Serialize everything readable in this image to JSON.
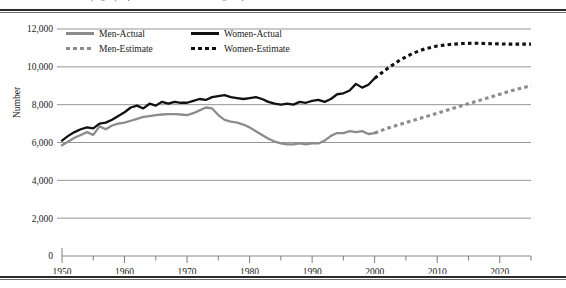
{
  "top_caption": "of 5 (English). http://www.imdb.com/chart/ch07/tt0_chart.pdf",
  "legend": {
    "items": [
      {
        "label": "Men-Actual",
        "style": "solid",
        "color": "#8c8c8c"
      },
      {
        "label": "Women-Actual",
        "style": "solid",
        "color": "#111111"
      },
      {
        "label": "Men-Estimate",
        "style": "dashed",
        "color": "#8c8c8c"
      },
      {
        "label": "Women-Estimate",
        "style": "dashed",
        "color": "#111111"
      }
    ]
  },
  "chart_data": {
    "type": "line",
    "title": "",
    "xlabel": "",
    "ylabel": "Number",
    "xlim": [
      1950,
      2025
    ],
    "ylim": [
      0,
      12000
    ],
    "grid": true,
    "legend_position": "top-left-inside",
    "ytick_labels": [
      "0",
      "2,000",
      "4,000",
      "6,000",
      "8,000",
      "10,000",
      "12,000"
    ],
    "ytick_values": [
      0,
      2000,
      4000,
      6000,
      8000,
      10000,
      12000
    ],
    "xtick_labels": [
      "1950",
      "1960",
      "1970",
      "1980",
      "1990",
      "2000",
      "2010",
      "2020"
    ],
    "xtick_values": [
      1950,
      1960,
      1970,
      1980,
      1990,
      2000,
      2010,
      2020
    ],
    "xminor_step": 5,
    "series": [
      {
        "name": "Men-Actual",
        "style": "solid",
        "color": "#8c8c8c",
        "x": [
          1950,
          1951,
          1952,
          1953,
          1954,
          1955,
          1956,
          1957,
          1958,
          1959,
          1960,
          1961,
          1962,
          1963,
          1964,
          1965,
          1966,
          1967,
          1968,
          1969,
          1970,
          1971,
          1972,
          1973,
          1974,
          1975,
          1976,
          1977,
          1978,
          1979,
          1980,
          1981,
          1982,
          1983,
          1984,
          1985,
          1986,
          1987,
          1988,
          1989,
          1990,
          1991,
          1992,
          1993,
          1994,
          1995,
          1996,
          1997,
          1998,
          1999,
          2000
        ],
        "y": [
          5850,
          6050,
          6250,
          6400,
          6550,
          6400,
          6850,
          6700,
          6900,
          7000,
          7050,
          7150,
          7250,
          7350,
          7400,
          7450,
          7480,
          7500,
          7500,
          7480,
          7450,
          7550,
          7700,
          7850,
          7800,
          7450,
          7200,
          7100,
          7050,
          6950,
          6800,
          6600,
          6400,
          6200,
          6050,
          5950,
          5900,
          5900,
          5950,
          5900,
          5950,
          5950,
          6100,
          6350,
          6500,
          6500,
          6600,
          6550,
          6600,
          6450,
          6500
        ]
      },
      {
        "name": "Women-Actual",
        "style": "solid",
        "color": "#111111",
        "x": [
          1950,
          1951,
          1952,
          1953,
          1954,
          1955,
          1956,
          1957,
          1958,
          1959,
          1960,
          1961,
          1962,
          1963,
          1964,
          1965,
          1966,
          1967,
          1968,
          1969,
          1970,
          1971,
          1972,
          1973,
          1974,
          1975,
          1976,
          1977,
          1978,
          1979,
          1980,
          1981,
          1982,
          1983,
          1984,
          1985,
          1986,
          1987,
          1988,
          1989,
          1990,
          1991,
          1992,
          1993,
          1994,
          1995,
          1996,
          1997,
          1998,
          1999,
          2000
        ],
        "y": [
          6100,
          6350,
          6550,
          6700,
          6800,
          6750,
          7000,
          7050,
          7200,
          7400,
          7600,
          7850,
          7950,
          7800,
          8050,
          7950,
          8150,
          8050,
          8150,
          8100,
          8100,
          8200,
          8300,
          8250,
          8400,
          8450,
          8500,
          8400,
          8350,
          8300,
          8350,
          8400,
          8300,
          8150,
          8050,
          8000,
          8050,
          8000,
          8150,
          8100,
          8200,
          8250,
          8150,
          8300,
          8550,
          8600,
          8750,
          9100,
          8900,
          9050,
          9400
        ]
      },
      {
        "name": "Men-Estimate",
        "style": "dashed",
        "color": "#8c8c8c",
        "x": [
          2000,
          2002,
          2004,
          2006,
          2008,
          2010,
          2012,
          2014,
          2016,
          2018,
          2020,
          2022,
          2025
        ],
        "y": [
          6500,
          6750,
          6950,
          7150,
          7350,
          7550,
          7750,
          7950,
          8150,
          8350,
          8550,
          8750,
          9000
        ]
      },
      {
        "name": "Women-Estimate",
        "style": "dashed",
        "color": "#111111",
        "x": [
          2000,
          2002,
          2004,
          2006,
          2008,
          2010,
          2012,
          2014,
          2016,
          2018,
          2020,
          2022,
          2025
        ],
        "y": [
          9400,
          9900,
          10350,
          10700,
          10950,
          11100,
          11180,
          11230,
          11250,
          11230,
          11210,
          11200,
          11200
        ]
      }
    ]
  }
}
